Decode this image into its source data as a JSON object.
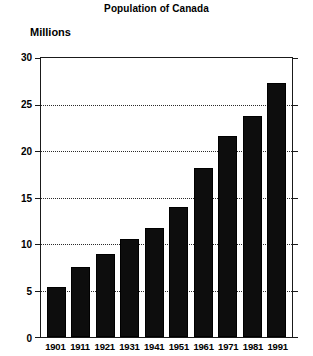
{
  "chart_data": {
    "type": "bar",
    "title": "Population of Canada",
    "xlabel": "",
    "ylabel": "Millions",
    "ylim": [
      0,
      30
    ],
    "ytick_labels": [
      "30",
      "25",
      "20",
      "15",
      "10",
      "5",
      "0"
    ],
    "yticks": [
      30,
      25,
      20,
      15,
      10,
      5,
      0
    ],
    "grid": "horizontal-dotted",
    "legend": "none",
    "categories": [
      "1901",
      "1911",
      "1921",
      "1931",
      "1941",
      "1951",
      "1961",
      "1971",
      "1981",
      "1991"
    ],
    "values": [
      5.4,
      7.5,
      8.9,
      10.5,
      11.7,
      14.0,
      18.2,
      21.6,
      23.8,
      27.3
    ],
    "bar_color": "#0d0d0d"
  }
}
